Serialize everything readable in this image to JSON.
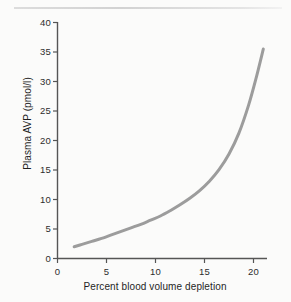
{
  "chart_data": {
    "type": "line",
    "title": "",
    "subtitle": "",
    "xlabel": "Percent blood volume depletion",
    "ylabel": "Plasma AVP (pmol/l)",
    "xlim": [
      0,
      21.5
    ],
    "ylim": [
      0,
      40
    ],
    "xticks": [
      0,
      5,
      10,
      15,
      20
    ],
    "xtick_labels": [
      "0",
      "5",
      "10",
      "15",
      "20"
    ],
    "yticks": [
      0,
      5,
      10,
      15,
      20,
      25,
      30,
      35,
      40
    ],
    "ytick_labels": [
      "0",
      "5",
      "10",
      "15",
      "20",
      "25",
      "30",
      "35",
      "40"
    ],
    "grid": false,
    "legend": false,
    "legend_position": "none",
    "series": [
      {
        "name": "Plasma AVP response to blood volume depletion",
        "color": "#9c9c9c",
        "line_width": 3,
        "x": [
          1.7,
          2.5,
          3.5,
          4.5,
          5.5,
          6.5,
          7.5,
          8.5,
          9.5,
          10.5,
          11.5,
          12.5,
          13.5,
          14.5,
          15.5,
          16.5,
          17.5,
          18.5,
          19.5,
          20.3,
          21.0
        ],
        "y": [
          2.0,
          2.4,
          2.9,
          3.4,
          4.0,
          4.6,
          5.2,
          5.8,
          6.5,
          7.2,
          8.1,
          9.1,
          10.2,
          11.5,
          13.1,
          15.1,
          17.7,
          21.2,
          26.0,
          30.8,
          35.5
        ]
      }
    ],
    "annotations": [],
    "axis_color": "#555555",
    "text_color": "#1f1f1f",
    "background_color": "#fbfbfa"
  },
  "figure": {
    "top_rule_name": "decorative-top-rule"
  }
}
